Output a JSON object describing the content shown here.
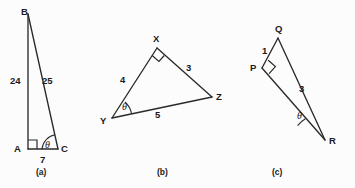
{
  "figure": {
    "background_color": "#fcfcfc",
    "stroke_color": "#2a2a2a",
    "text_color": "#1a1a1a",
    "panels": [
      {
        "caption": "(a)",
        "vertices": [
          {
            "name": "B",
            "label": "B"
          },
          {
            "name": "A",
            "label": "A"
          },
          {
            "name": "C",
            "label": "C"
          }
        ],
        "sides": [
          {
            "name": "AB",
            "label": "24"
          },
          {
            "name": "BC",
            "label": "25"
          },
          {
            "name": "AC",
            "label": "7"
          }
        ],
        "angles": [
          {
            "name": "right-angle-at-A",
            "label": ""
          },
          {
            "name": "theta-at-C",
            "label": "θ"
          }
        ]
      },
      {
        "caption": "(b)",
        "vertices": [
          {
            "name": "X",
            "label": "X"
          },
          {
            "name": "Y",
            "label": "Y"
          },
          {
            "name": "Z",
            "label": "Z"
          }
        ],
        "sides": [
          {
            "name": "XY",
            "label": "4"
          },
          {
            "name": "XZ",
            "label": "3"
          },
          {
            "name": "YZ",
            "label": "5"
          }
        ],
        "angles": [
          {
            "name": "right-angle-at-X",
            "label": ""
          },
          {
            "name": "theta-at-Y",
            "label": "θ"
          }
        ]
      },
      {
        "caption": "(c)",
        "vertices": [
          {
            "name": "Q",
            "label": "Q"
          },
          {
            "name": "P",
            "label": "P"
          },
          {
            "name": "R",
            "label": "R"
          }
        ],
        "sides": [
          {
            "name": "PQ",
            "label": "1"
          },
          {
            "name": "QR",
            "label": "3"
          },
          {
            "name": "PR",
            "label": ""
          }
        ],
        "angles": [
          {
            "name": "right-angle-at-P",
            "label": ""
          },
          {
            "name": "theta-at-R",
            "label": "θ"
          }
        ]
      }
    ]
  }
}
